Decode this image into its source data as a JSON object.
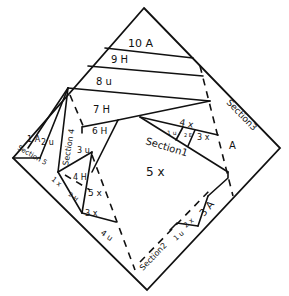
{
  "diagram": {
    "labels": {
      "p10a": "10 A",
      "p9h": "9 H",
      "p8u": "8 u",
      "p7h": "7 H",
      "p6h": "6 H",
      "p4x_top": "4 x",
      "p1u_top": "1 u",
      "p2e": "2 E",
      "p3x_top": "3 x",
      "pA_right": "A",
      "section1": "Section1",
      "p5x_main": "5 x",
      "section3": "Section3",
      "section4": "Section 4",
      "p3u": "3 u",
      "p1a_left": "1 A",
      "p2u_left": "2 u",
      "section5": "Section 5",
      "p1x_left": "1 x",
      "p4h": "4 H",
      "p5x_left": "5 x",
      "p2h": "2 H",
      "p3x_left": "3 x",
      "p4u": "4 u",
      "section2": "Section2",
      "p1u_bottom": "1 u",
      "p2x_bottom": "2 x",
      "p3a_bottom": "3 A"
    }
  }
}
